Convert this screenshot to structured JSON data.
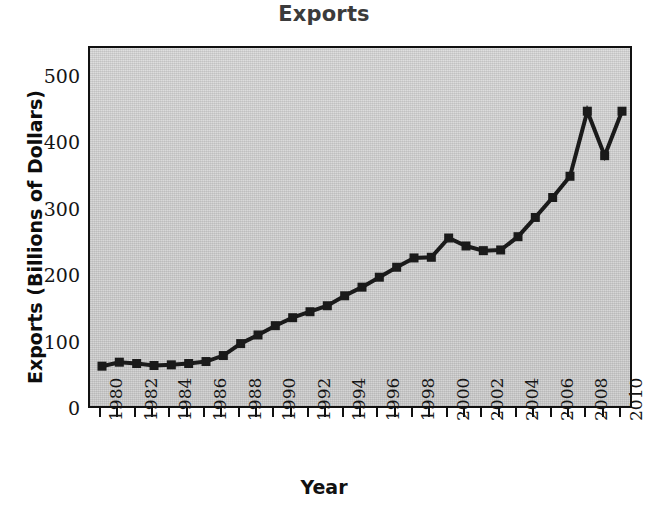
{
  "chart_data": {
    "type": "line",
    "title": "Exports",
    "xlabel": "Year",
    "ylabel": "Exports (Billions of Dollars)",
    "xlim": [
      1980,
      2010
    ],
    "ylim": [
      0,
      530
    ],
    "grid": false,
    "legend": null,
    "marker": "square",
    "line_color": "#1a1a1a",
    "marker_color": "#1a1a1a",
    "plot_background": "#cfcfcf",
    "x": [
      1980,
      1981,
      1982,
      1983,
      1984,
      1985,
      1986,
      1987,
      1988,
      1989,
      1990,
      1991,
      1992,
      1993,
      1994,
      1995,
      1996,
      1997,
      1998,
      1999,
      2000,
      2001,
      2002,
      2003,
      2004,
      2005,
      2006,
      2007,
      2008,
      2009,
      2010
    ],
    "values": [
      66,
      72,
      70,
      67,
      68,
      70,
      73,
      82,
      100,
      113,
      127,
      139,
      148,
      157,
      172,
      185,
      200,
      215,
      229,
      230,
      259,
      247,
      240,
      241,
      261,
      290,
      320,
      352,
      450,
      383,
      450
    ],
    "y_ticks": [
      0,
      100,
      200,
      300,
      400,
      500
    ],
    "y_tick_labels": [
      "0",
      "100",
      "200",
      "300",
      "400",
      "500"
    ],
    "x_tick_labels": [
      "1980",
      "1982",
      "1984",
      "1986",
      "1988",
      "1990",
      "1992",
      "1994",
      "1996",
      "1998",
      "2000",
      "2002",
      "2004",
      "2006",
      "2008",
      "2010"
    ],
    "x_tick_label_years": [
      1980,
      1982,
      1984,
      1986,
      1988,
      1990,
      1992,
      1994,
      1996,
      1998,
      2000,
      2002,
      2004,
      2006,
      2008,
      2010
    ],
    "x_minor_tick_years": [
      1980,
      1981,
      1982,
      1983,
      1984,
      1985,
      1986,
      1987,
      1988,
      1989,
      1990,
      1991,
      1992,
      1993,
      1994,
      1995,
      1996,
      1997,
      1998,
      1999,
      2000,
      2001,
      2002,
      2003,
      2004,
      2005,
      2006,
      2007,
      2008,
      2009,
      2010
    ]
  }
}
